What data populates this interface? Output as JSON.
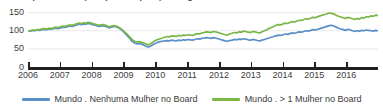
{
  "chart_data": {
    "type": "line",
    "title": "Desempenho das ações por composição de género do Board",
    "xlabel": "",
    "ylabel": "",
    "xlim": [
      2006,
      2017
    ],
    "ylim": [
      0,
      160
    ],
    "grid": true,
    "grid_axis": "y",
    "legend_position": "bottom",
    "y_ticks": [
      0,
      50,
      100,
      150
    ],
    "y_tick_labels": [
      "0",
      "50",
      "100",
      "150"
    ],
    "x_ticks": [
      2006,
      2007,
      2008,
      2009,
      2010,
      2011,
      2012,
      2013,
      2014,
      2015,
      2016
    ],
    "x_tick_labels": [
      "2006",
      "2007",
      "2008",
      "2009",
      "2010",
      "2011",
      "2012",
      "2013",
      "2014",
      "2015",
      "2016"
    ],
    "colors": {
      "series_no_women": "#5B8FC7",
      "series_more_women": "#7AB648",
      "axis": "#231f20",
      "gridline": "#e9e9ec",
      "text": "#3a3a3a"
    },
    "series": [
      {
        "name": "Mundo . Nenhuma Mulher no Board",
        "color": "#5B8FC7",
        "values": [
          100,
          99,
          101,
          100,
          102,
          101,
          103,
          104,
          103,
          105,
          104,
          106,
          107,
          106,
          108,
          110,
          109,
          111,
          113,
          112,
          114,
          116,
          118,
          117,
          119,
          118,
          120,
          119,
          117,
          115,
          113,
          112,
          114,
          113,
          111,
          108,
          110,
          112,
          111,
          108,
          104,
          99,
          92,
          85,
          78,
          70,
          66,
          64,
          65,
          63,
          60,
          57,
          55,
          58,
          62,
          65,
          68,
          70,
          71,
          72,
          73,
          72,
          74,
          73,
          72,
          74,
          73,
          75,
          74,
          76,
          75,
          74,
          76,
          78,
          77,
          79,
          80,
          81,
          80,
          79,
          81,
          80,
          78,
          76,
          74,
          72,
          71,
          73,
          74,
          76,
          75,
          77,
          76,
          78,
          77,
          75,
          74,
          76,
          75,
          73,
          72,
          74,
          76,
          78,
          80,
          82,
          84,
          86,
          88,
          87,
          89,
          91,
          90,
          92,
          94,
          93,
          95,
          97,
          96,
          98,
          100,
          99,
          101,
          103,
          102,
          104,
          106,
          108,
          110,
          112,
          114,
          115,
          113,
          110,
          107,
          105,
          103,
          101,
          104,
          102,
          100,
          98,
          100,
          99,
          101,
          100,
          102,
          101,
          100,
          99,
          101,
          100
        ]
      },
      {
        "name": "Mundo . > 1 Mulher no Board",
        "color": "#7AB648",
        "values": [
          100,
          100,
          102,
          101,
          103,
          103,
          105,
          106,
          105,
          107,
          106,
          108,
          110,
          109,
          111,
          113,
          112,
          114,
          116,
          115,
          117,
          119,
          121,
          120,
          122,
          121,
          123,
          122,
          120,
          118,
          116,
          115,
          117,
          116,
          114,
          111,
          113,
          114,
          113,
          110,
          106,
          101,
          95,
          89,
          82,
          75,
          71,
          69,
          70,
          68,
          66,
          63,
          61,
          65,
          69,
          73,
          76,
          78,
          80,
          82,
          84,
          83,
          86,
          85,
          84,
          87,
          86,
          88,
          87,
          89,
          88,
          87,
          90,
          92,
          91,
          94,
          95,
          97,
          96,
          95,
          98,
          97,
          95,
          93,
          91,
          89,
          88,
          91,
          93,
          95,
          94,
          97,
          96,
          99,
          98,
          96,
          95,
          98,
          97,
          95,
          94,
          97,
          100,
          103,
          106,
          109,
          112,
          115,
          117,
          116,
          119,
          121,
          120,
          123,
          125,
          124,
          127,
          129,
          128,
          131,
          133,
          132,
          135,
          137,
          136,
          139,
          141,
          143,
          145,
          147,
          149,
          148,
          146,
          143,
          140,
          138,
          136,
          134,
          137,
          135,
          133,
          131,
          134,
          132,
          136,
          135,
          139,
          138,
          141,
          140,
          143,
          142
        ]
      }
    ]
  },
  "legend": {
    "items": [
      {
        "label": "Mundo . Nenhuma Mulher no Board",
        "color": "#5B8FC7"
      },
      {
        "label": "Mundo . > 1 Mulher no Board",
        "color": "#7AB648"
      }
    ]
  }
}
